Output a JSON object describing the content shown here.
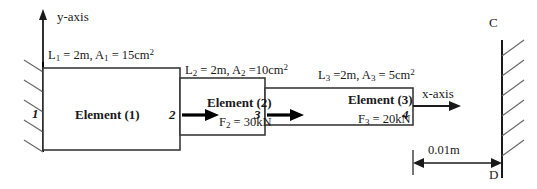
{
  "diagram": {
    "axes": {
      "y_axis_label": "y-axis",
      "x_axis_label": "x-axis"
    },
    "elements": [
      {
        "name": "Element (1)",
        "length_area_label": "L1 = 2m, A1 = 15cm2",
        "L_symbol": "L",
        "L_sub": "1",
        "L_value": " = 2m, ",
        "A_symbol": "A",
        "A_sub": "1",
        "A_value": " = 15cm",
        "A_sup": "2",
        "force_label": "",
        "force_symbol": "",
        "force_sub": "",
        "force_value": ""
      },
      {
        "name": "Element (2)",
        "length_area_label": "L2 = 2m, A2 =10cm2",
        "L_symbol": "L",
        "L_sub": "2",
        "L_value": " = 2m, ",
        "A_symbol": "A",
        "A_sub": "2",
        "A_value": " =10cm",
        "A_sup": "2",
        "force_label": "F2 = 30kN",
        "force_symbol": "F",
        "force_sub": "2",
        "force_value": " = 30kN"
      },
      {
        "name": "Element (3)",
        "length_area_label": "L3 =2m, A3 = 5cm2",
        "L_symbol": "L",
        "L_sub": "3",
        "L_value": " =2m, ",
        "A_symbol": "A",
        "A_sub": "3",
        "A_value": " = 5cm",
        "A_sup": "2",
        "force_label": "F3 = 20kN",
        "force_symbol": "F",
        "force_sub": "3",
        "force_value": " = 20kN"
      }
    ],
    "nodes": [
      {
        "id": "1",
        "label": "1"
      },
      {
        "id": "2",
        "label": "2"
      },
      {
        "id": "3",
        "label": "3"
      },
      {
        "id": "4",
        "label": "4"
      }
    ],
    "walls": {
      "left_support": "fixed-hatched-wall",
      "right_support": "fixed-hatched-wall",
      "right_top_label": "C",
      "right_bottom_label": "D"
    },
    "gap": {
      "dimension_label": "0.01m"
    },
    "colors": {
      "stroke": "#000000",
      "text": "#1a1a1a",
      "hatch": "#555555",
      "background": "#ffffff"
    }
  }
}
